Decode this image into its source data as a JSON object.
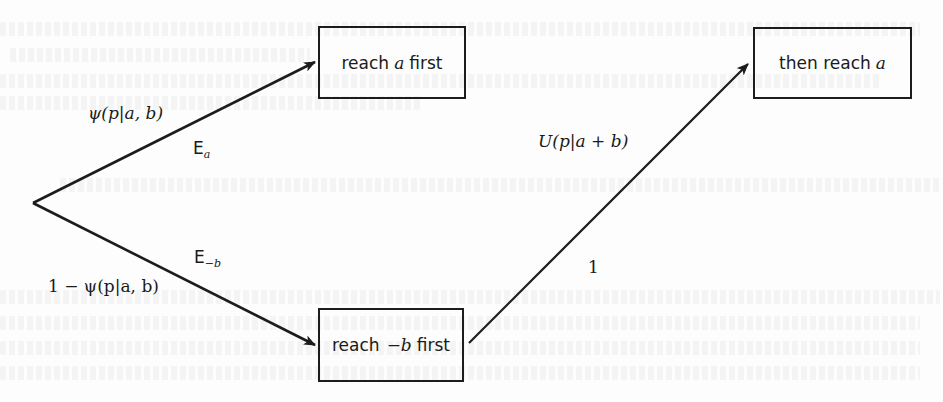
{
  "diagram": {
    "type": "probability-tree",
    "origin": {
      "x": 33,
      "y": 203
    },
    "nodes": [
      {
        "id": "reach-a-first",
        "text_prefix": "reach",
        "math": "a",
        "text_suffix": "first",
        "box": {
          "x": 318,
          "y": 26,
          "w": 148,
          "h": 73
        }
      },
      {
        "id": "then-reach-a",
        "text_prefix": "then reach",
        "math": "a",
        "text_suffix": "",
        "box": {
          "x": 753,
          "y": 27,
          "w": 159,
          "h": 72
        }
      },
      {
        "id": "reach-minus-b-first",
        "text_prefix": "reach",
        "math": "−b",
        "text_suffix": "first",
        "box": {
          "x": 318,
          "y": 308,
          "w": 146,
          "h": 74
        }
      }
    ],
    "edges": [
      {
        "from": "origin",
        "to": "reach-a-first",
        "x1": 33,
        "y1": 203,
        "x2": 315,
        "y2": 62,
        "prob_label": "ψ(p|a, b)",
        "event_label": "E",
        "event_sub": "a"
      },
      {
        "from": "origin",
        "to": "reach-minus-b-first",
        "x1": 33,
        "y1": 203,
        "x2": 315,
        "y2": 345,
        "prob_label": "1 − ψ(p|a, b)",
        "event_label": "E",
        "event_sub": "−b"
      },
      {
        "from": "reach-minus-b-first",
        "to": "then-reach-a",
        "x1": 469,
        "y1": 343,
        "x2": 748,
        "y2": 64,
        "prob_label": "U(p|a + b)",
        "event_label": "1"
      }
    ],
    "labels": {
      "psi": "ψ(p|a, b)",
      "one_minus_psi": "1 − ψ(p|a, b)",
      "u": "U(p|a + b)",
      "one": "1",
      "e_letter": "E",
      "e_sub_a": "a",
      "e_sub_minus_b": "−b"
    },
    "colors": {
      "stroke": "#1c1c1c",
      "text": "#1a1a1a",
      "background": "#fdfdfd"
    }
  }
}
